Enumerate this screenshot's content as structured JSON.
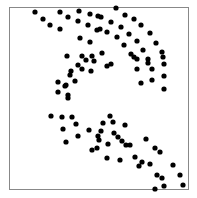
{
  "chart_data": {
    "type": "scatter",
    "title": "",
    "xlabel": "",
    "ylabel": "",
    "grid": false,
    "legend": null,
    "frame": {
      "left": 9,
      "top": 7,
      "right": 188,
      "bottom": 189,
      "color": "#888888"
    },
    "marker": {
      "color": "#000000",
      "radius": 2.6
    },
    "points_px": [
      [
        35,
        12
      ],
      [
        43,
        19
      ],
      [
        50,
        25
      ],
      [
        60,
        29
      ],
      [
        60,
        12
      ],
      [
        68,
        17
      ],
      [
        79,
        11
      ],
      [
        78,
        21
      ],
      [
        90,
        14
      ],
      [
        88,
        25
      ],
      [
        98,
        16
      ],
      [
        97,
        30
      ],
      [
        80,
        38
      ],
      [
        90,
        42
      ],
      [
        67,
        56
      ],
      [
        82,
        56
      ],
      [
        94,
        61
      ],
      [
        71,
        71
      ],
      [
        82,
        69
      ],
      [
        91,
        71
      ],
      [
        58,
        82
      ],
      [
        66,
        85
      ],
      [
        75,
        81
      ],
      [
        58,
        92
      ],
      [
        68,
        98
      ],
      [
        116,
        8
      ],
      [
        125,
        15
      ],
      [
        134,
        19
      ],
      [
        141,
        25
      ],
      [
        150,
        33
      ],
      [
        156,
        43
      ],
      [
        162,
        52
      ],
      [
        164,
        64
      ],
      [
        164,
        76
      ],
      [
        164,
        89
      ],
      [
        101,
        17
      ],
      [
        111,
        22
      ],
      [
        121,
        27
      ],
      [
        129,
        34
      ],
      [
        137,
        41
      ],
      [
        143,
        50
      ],
      [
        148,
        59
      ],
      [
        152,
        69
      ],
      [
        152,
        80
      ],
      [
        100,
        29
      ],
      [
        107,
        32
      ],
      [
        117,
        37
      ],
      [
        124,
        45
      ],
      [
        131,
        54
      ],
      [
        137,
        59
      ],
      [
        137,
        69
      ],
      [
        141,
        83
      ],
      [
        107,
        66
      ],
      [
        111,
        64
      ],
      [
        102,
        53
      ],
      [
        92,
        56
      ],
      [
        86,
        60
      ],
      [
        78,
        65
      ],
      [
        70,
        75
      ],
      [
        65,
        86
      ],
      [
        68,
        95
      ],
      [
        134,
        57
      ],
      [
        148,
        63
      ],
      [
        163,
        57
      ],
      [
        51,
        116
      ],
      [
        62,
        117
      ],
      [
        72,
        117
      ],
      [
        76,
        124
      ],
      [
        63,
        129
      ],
      [
        78,
        136
      ],
      [
        89,
        130
      ],
      [
        98,
        136
      ],
      [
        97,
        148
      ],
      [
        66,
        142
      ],
      [
        110,
        116
      ],
      [
        103,
        123
      ],
      [
        113,
        122
      ],
      [
        101,
        131
      ],
      [
        125,
        125
      ],
      [
        118,
        137
      ],
      [
        126,
        145
      ],
      [
        108,
        144
      ],
      [
        130,
        145
      ],
      [
        135,
        157
      ],
      [
        142,
        162
      ],
      [
        139,
        166
      ],
      [
        150,
        164
      ],
      [
        157,
        175
      ],
      [
        162,
        178
      ],
      [
        164,
        186
      ],
      [
        155,
        189
      ],
      [
        183,
        185
      ],
      [
        180,
        175
      ],
      [
        173,
        165
      ],
      [
        160,
        152
      ],
      [
        155,
        148
      ],
      [
        146,
        139
      ],
      [
        122,
        141
      ],
      [
        114,
        133
      ],
      [
        99,
        140
      ],
      [
        92,
        150
      ],
      [
        120,
        160
      ],
      [
        107,
        158
      ]
    ]
  }
}
